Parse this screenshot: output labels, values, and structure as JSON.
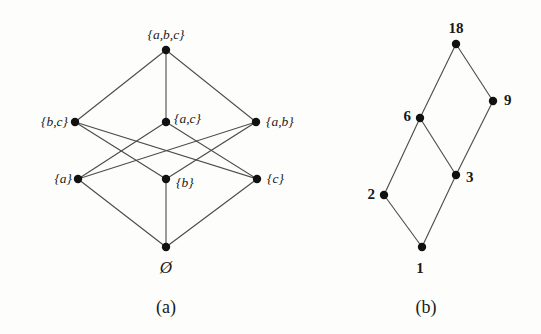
{
  "figure": {
    "background_color": "#fdfdfc",
    "ink_color": "#1a1a1a",
    "edge_color": "#4a4a4a",
    "node_color": "#111111"
  },
  "diagram_a": {
    "caption": "(a)",
    "caption_pos": {
      "x": 166,
      "y": 307
    },
    "description": "Hasse diagram of the power set of {a,b,c} ordered by inclusion",
    "nodes": [
      {
        "id": "abc",
        "label": "{a,b,c}",
        "x": 166,
        "y": 50,
        "label_anchor": "center",
        "label_dx": 0,
        "label_dy": -15,
        "style": "italic"
      },
      {
        "id": "bc",
        "label": "{b,c}",
        "x": 75,
        "y": 122,
        "label_anchor": "left",
        "label_dx": -7,
        "label_dy": 0,
        "style": "italic"
      },
      {
        "id": "ac",
        "label": "{a,c}",
        "x": 166,
        "y": 122,
        "label_anchor": "right",
        "label_dx": 8,
        "label_dy": -3,
        "style": "italic"
      },
      {
        "id": "ab",
        "label": "{a,b}",
        "x": 256,
        "y": 122,
        "label_anchor": "right",
        "label_dx": 10,
        "label_dy": 0,
        "style": "italic"
      },
      {
        "id": "a",
        "label": "{a}",
        "x": 78,
        "y": 179,
        "label_anchor": "left",
        "label_dx": -6,
        "label_dy": 0,
        "style": "italic"
      },
      {
        "id": "b",
        "label": "{b}",
        "x": 166,
        "y": 179,
        "label_anchor": "right",
        "label_dx": 10,
        "label_dy": 4,
        "style": "italic"
      },
      {
        "id": "c",
        "label": "{c}",
        "x": 257,
        "y": 179,
        "label_anchor": "right",
        "label_dx": 10,
        "label_dy": 0,
        "style": "italic"
      },
      {
        "id": "empty",
        "label": "Ø",
        "x": 166,
        "y": 247,
        "label_anchor": "center",
        "label_dx": 0,
        "label_dy": 20,
        "style": "empty-set"
      }
    ],
    "edges": [
      {
        "from": "abc",
        "to": "bc"
      },
      {
        "from": "abc",
        "to": "ac"
      },
      {
        "from": "abc",
        "to": "ab"
      },
      {
        "from": "bc",
        "to": "b"
      },
      {
        "from": "bc",
        "to": "c"
      },
      {
        "from": "ac",
        "to": "a"
      },
      {
        "from": "ac",
        "to": "c"
      },
      {
        "from": "ab",
        "to": "a"
      },
      {
        "from": "ab",
        "to": "b"
      },
      {
        "from": "a",
        "to": "empty"
      },
      {
        "from": "b",
        "to": "empty"
      },
      {
        "from": "c",
        "to": "empty"
      }
    ]
  },
  "diagram_b": {
    "caption": "(b)",
    "caption_pos": {
      "x": 426,
      "y": 307
    },
    "description": "Hasse diagram of the divisors of 18 ordered by divisibility",
    "nodes": [
      {
        "id": "n18",
        "label": "18",
        "x": 456,
        "y": 44,
        "label_anchor": "center",
        "label_dx": 0,
        "label_dy": -16,
        "style": "plain"
      },
      {
        "id": "n9",
        "label": "9",
        "x": 493,
        "y": 101,
        "label_anchor": "right",
        "label_dx": 11,
        "label_dy": -1,
        "style": "plain"
      },
      {
        "id": "n6",
        "label": "6",
        "x": 420,
        "y": 118,
        "label_anchor": "left",
        "label_dx": -9,
        "label_dy": -2,
        "style": "plain"
      },
      {
        "id": "n3",
        "label": "3",
        "x": 456,
        "y": 175,
        "label_anchor": "right",
        "label_dx": 10,
        "label_dy": 2,
        "style": "plain"
      },
      {
        "id": "n2",
        "label": "2",
        "x": 384,
        "y": 195,
        "label_anchor": "left",
        "label_dx": -9,
        "label_dy": -1,
        "style": "plain"
      },
      {
        "id": "n1",
        "label": "1",
        "x": 422,
        "y": 247,
        "label_anchor": "center",
        "label_dx": -2,
        "label_dy": 21,
        "style": "plain"
      }
    ],
    "edges": [
      {
        "from": "n18",
        "to": "n9"
      },
      {
        "from": "n18",
        "to": "n6"
      },
      {
        "from": "n9",
        "to": "n3"
      },
      {
        "from": "n6",
        "to": "n3"
      },
      {
        "from": "n6",
        "to": "n2"
      },
      {
        "from": "n3",
        "to": "n1"
      },
      {
        "from": "n2",
        "to": "n1"
      }
    ]
  }
}
